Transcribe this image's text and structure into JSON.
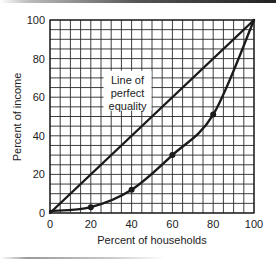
{
  "chart_data": {
    "type": "line",
    "title": "",
    "xlabel": "Percent of households",
    "ylabel": "Percent of income",
    "xlim": [
      0,
      100
    ],
    "ylim": [
      0,
      100
    ],
    "x_ticks": [
      0,
      20,
      40,
      60,
      80,
      100
    ],
    "y_ticks": [
      0,
      20,
      40,
      60,
      80,
      100
    ],
    "grid": true,
    "grid_step": 5,
    "legend": null,
    "series": [
      {
        "name": "Line of perfect equality",
        "x": [
          0,
          100
        ],
        "y": [
          0,
          100
        ],
        "markers": false
      },
      {
        "name": "Lorenz curve",
        "x": [
          0,
          20,
          40,
          60,
          80,
          100
        ],
        "y": [
          1,
          3,
          12,
          30,
          51,
          100
        ],
        "markers": true
      }
    ],
    "annotations": [
      {
        "text_lines": [
          "Line of",
          "perfect",
          "equality"
        ],
        "x": 38,
        "y": 67
      }
    ]
  },
  "colors": {
    "line": "#1a1a1a",
    "grid": "#2a2a2a",
    "background": "#ffffff"
  }
}
